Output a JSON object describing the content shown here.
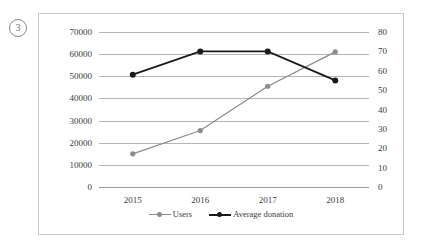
{
  "question_number": "3",
  "chart_data": {
    "type": "line",
    "title": "",
    "subtitle": "",
    "xlabel": "",
    "ylabel": "",
    "categories": [
      "2015",
      "2016",
      "2017",
      "2018"
    ],
    "grid": true,
    "legend_position": "bottom",
    "axes": {
      "left": {
        "label": "",
        "ylim": [
          0,
          70000
        ],
        "ticks": [
          "0",
          "10000",
          "20000",
          "30000",
          "40000",
          "50000",
          "60000",
          "70000"
        ],
        "tick_values": [
          0,
          10000,
          20000,
          30000,
          40000,
          50000,
          60000,
          70000
        ],
        "series": "Users"
      },
      "right": {
        "label": "",
        "ylim": [
          0,
          80
        ],
        "ticks": [
          "0",
          "10",
          "20",
          "30",
          "40",
          "50",
          "60",
          "70",
          "80"
        ],
        "tick_values": [
          0,
          10,
          20,
          30,
          40,
          50,
          60,
          70,
          80
        ],
        "series": "Average donation"
      }
    },
    "series": [
      {
        "name": "Users",
        "axis": "left",
        "color": "#8c8c8c",
        "marker": "circle",
        "values": [
          15000,
          25500,
          45500,
          61000
        ]
      },
      {
        "name": "Average donation",
        "axis": "right",
        "color": "#1a1a1a",
        "marker": "circle",
        "values": [
          58,
          70,
          70,
          55
        ]
      }
    ]
  },
  "colors": {
    "users": "#8c8c8c",
    "average_donation": "#1a1a1a",
    "gridline": "#b5b5b5",
    "frame": "#c8c8c8",
    "text": "#3b3b3b"
  }
}
